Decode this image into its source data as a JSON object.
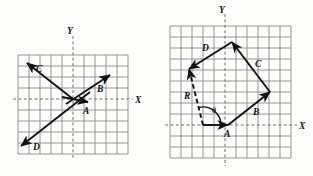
{
  "figure": {
    "background_color": "#fdfdfb",
    "ink_color": "#111111",
    "grid_color": "#8a8a88",
    "panels": [
      {
        "id": "left-panel",
        "name": "vector-diagram-left",
        "axis_x_label": "X",
        "axis_y_label": "Y",
        "grid": {
          "cols": 10,
          "rows": 9,
          "cell_px": 11
        },
        "vectors": [
          {
            "label": "A",
            "style": "solid",
            "description": "short vector from origin pointing right and slightly down"
          },
          {
            "label": "B",
            "style": "solid",
            "description": "vector from origin pointing up and to the right"
          },
          {
            "label": "C",
            "style": "solid",
            "description": "vector pointing up and to the left through origin"
          },
          {
            "label": "D",
            "style": "solid",
            "description": "vector pointing down and to the left through origin"
          }
        ]
      },
      {
        "id": "right-panel",
        "name": "vector-polygon-right",
        "axis_x_label": "X",
        "axis_y_label": "Y",
        "angle_label": "θ",
        "grid": {
          "cols": 11,
          "rows": 11,
          "cell_px": 11
        },
        "vectors": [
          {
            "label": "A",
            "style": "solid",
            "description": "vector along X axis pointing right, tail at start point"
          },
          {
            "label": "B",
            "style": "solid",
            "description": "vector up and to the right from head of A"
          },
          {
            "label": "C",
            "style": "solid",
            "description": "vector up and to the left from head of B"
          },
          {
            "label": "D",
            "style": "solid",
            "description": "vector down and to the left from head of C"
          },
          {
            "label": "R",
            "style": "dashed",
            "description": "resultant dashed vector from tail of A to head of D"
          }
        ]
      }
    ]
  }
}
